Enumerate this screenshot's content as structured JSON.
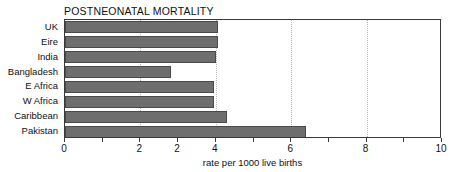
{
  "chart_data": {
    "type": "bar",
    "orientation": "horizontal",
    "title": "POSTNEONATAL MORTALITY",
    "xlabel": "rate per 1000 live births",
    "ylabel": "",
    "xlim": [
      0,
      10
    ],
    "grid": true,
    "legend": null,
    "categories": [
      "UK",
      "Eire",
      "India",
      "Bangladesh",
      "E Africa",
      "W Africa",
      "Caribbean",
      "Pakistan"
    ],
    "values": [
      4.05,
      4.05,
      4.0,
      2.8,
      3.95,
      3.95,
      4.3,
      6.4
    ],
    "xticks": [
      0,
      1,
      2,
      3,
      4,
      5,
      6,
      7,
      8,
      9,
      10
    ],
    "xtick_labels": [
      {
        "value": 0,
        "label": "0"
      },
      {
        "value": 2,
        "label": "2"
      },
      {
        "value": 3,
        "label": "2"
      },
      {
        "value": 4,
        "label": "4"
      },
      {
        "value": 6,
        "label": "6"
      },
      {
        "value": 8,
        "label": "8"
      },
      {
        "value": 10,
        "label": "10"
      }
    ],
    "gridlines": [
      2,
      4,
      6,
      8,
      10
    ],
    "colors": {
      "bar_fill": "#6e6e6e",
      "bar_edge": "#4a4a4a",
      "frame": "#3a3a3a",
      "grid": "#b4b4b4",
      "text": "#111111",
      "background": "#ffffff"
    }
  }
}
